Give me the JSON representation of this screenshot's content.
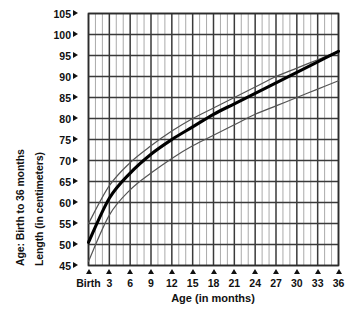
{
  "chart_data": {
    "type": "line",
    "title": "",
    "xlabel": "Age (in months)",
    "ylabel": "Length (in centimeters)",
    "secondary_ylabel": "Age: Birth to 36 months",
    "xlim": [
      0,
      36
    ],
    "ylim": [
      45,
      105
    ],
    "grid": true,
    "legend_position": "none",
    "x_tick_labels": [
      "Birth",
      "3",
      "6",
      "9",
      "12",
      "15",
      "18",
      "21",
      "24",
      "27",
      "30",
      "33",
      "36"
    ],
    "x_tick_values": [
      0,
      3,
      6,
      9,
      12,
      15,
      18,
      21,
      24,
      27,
      30,
      33,
      36
    ],
    "y_tick_labels": [
      "105",
      "100",
      "95",
      "90",
      "85",
      "80",
      "75",
      "70",
      "65",
      "60",
      "55",
      "50",
      "45"
    ],
    "y_tick_values": [
      105,
      100,
      95,
      90,
      85,
      80,
      75,
      70,
      65,
      60,
      55,
      50,
      45
    ],
    "x_minor_step": 1,
    "y_major_step": 5,
    "x": [
      0,
      3,
      6,
      9,
      12,
      15,
      18,
      21,
      24,
      27,
      30,
      33,
      36
    ],
    "series": [
      {
        "name": "upper percentile",
        "style": "thin",
        "values": [
          55.0,
          64.0,
          69.5,
          73.5,
          77.0,
          80.0,
          82.5,
          85.0,
          87.5,
          90.0,
          92.0,
          94.0,
          96.0
        ]
      },
      {
        "name": "median",
        "style": "thick",
        "values": [
          50.5,
          61.0,
          67.0,
          71.5,
          75.0,
          78.0,
          81.0,
          83.5,
          86.0,
          88.5,
          91.0,
          93.5,
          96.0
        ]
      },
      {
        "name": "lower percentile",
        "style": "thin",
        "values": [
          46.0,
          57.0,
          63.0,
          67.0,
          70.5,
          73.5,
          76.0,
          78.5,
          81.0,
          83.0,
          85.0,
          87.0,
          89.0
        ]
      }
    ],
    "annotations": []
  },
  "axes": {
    "left_outer_title": "Age: Birth to 36 months",
    "left_inner_title": "Length (in centimeters)",
    "bottom_title": "Age (in months)"
  },
  "y_ticks": [
    {
      "label": "105",
      "value": 105
    },
    {
      "label": "100",
      "value": 100
    },
    {
      "label": "95",
      "value": 95
    },
    {
      "label": "90",
      "value": 90
    },
    {
      "label": "85",
      "value": 85
    },
    {
      "label": "80",
      "value": 80
    },
    {
      "label": "75",
      "value": 75
    },
    {
      "label": "70",
      "value": 70
    },
    {
      "label": "65",
      "value": 65
    },
    {
      "label": "60",
      "value": 60
    },
    {
      "label": "55",
      "value": 55
    },
    {
      "label": "50",
      "value": 50
    },
    {
      "label": "45",
      "value": 45
    }
  ],
  "x_ticks": [
    {
      "label": "Birth",
      "value": 0
    },
    {
      "label": "3",
      "value": 3
    },
    {
      "label": "6",
      "value": 6
    },
    {
      "label": "9",
      "value": 9
    },
    {
      "label": "12",
      "value": 12
    },
    {
      "label": "15",
      "value": 15
    },
    {
      "label": "18",
      "value": 18
    },
    {
      "label": "21",
      "value": 21
    },
    {
      "label": "24",
      "value": 24
    },
    {
      "label": "27",
      "value": 27
    },
    {
      "label": "30",
      "value": 30
    },
    {
      "label": "33",
      "value": 33
    },
    {
      "label": "36",
      "value": 36
    }
  ],
  "colors": {
    "background": "#ffffff",
    "text": "#111111",
    "major_gridline": "#3a3a3a",
    "minor_gridline": "#aaaaaa",
    "curve_thick": "#000000",
    "curve_thin": "#555555"
  }
}
